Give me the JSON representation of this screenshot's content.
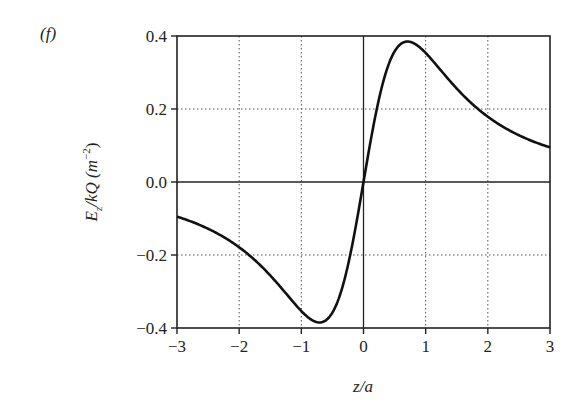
{
  "panel_label": "(f)",
  "chart_data": {
    "type": "line",
    "title": "",
    "xlabel": "z/a",
    "ylabel": "E_z/kQ (m^-2)",
    "xlim": [
      -3,
      3
    ],
    "ylim": [
      -0.4,
      0.4
    ],
    "xticks": [
      -3,
      -2,
      -1,
      0,
      1,
      2,
      3
    ],
    "xtick_labels": [
      "−3",
      "−2",
      "−1",
      "0",
      "1",
      "2",
      "3"
    ],
    "yticks": [
      -0.4,
      -0.2,
      0.0,
      0.2,
      0.4
    ],
    "ytick_labels": [
      "−0.4",
      "−0.2",
      "0.0",
      "0.2",
      "0.4"
    ],
    "grid": "dotted",
    "legend": null,
    "series": [
      {
        "name": "E_z/kQ",
        "function": "z/(1+z^2)^(3/2)",
        "x": [
          -3,
          -2.5,
          -2,
          -1.5,
          -1,
          -0.707,
          -0.5,
          -0.25,
          0,
          0.25,
          0.5,
          0.707,
          1,
          1.5,
          2,
          2.5,
          3
        ],
        "values": [
          -0.095,
          -0.124,
          -0.179,
          -0.256,
          -0.354,
          -0.385,
          -0.358,
          -0.226,
          0,
          0.226,
          0.358,
          0.385,
          0.354,
          0.256,
          0.179,
          0.124,
          0.095
        ]
      }
    ]
  },
  "ylabel_parts": {
    "E": "E",
    "sub": "z",
    "rest": "/kQ (m",
    "sup": "−2",
    "close": ")"
  }
}
